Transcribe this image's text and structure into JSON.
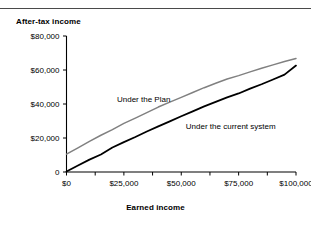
{
  "chart_data": {
    "type": "line",
    "title": "",
    "xlabel": "Earned income",
    "ylabel": "After-tax income",
    "xlim": [
      0,
      100000
    ],
    "ylim": [
      0,
      80000
    ],
    "grid": false,
    "legend_position": "inline-annotations",
    "x_ticks": [
      "$0",
      "$25,000",
      "$50,000",
      "$75,000",
      "$100,000"
    ],
    "x_tick_values": [
      0,
      25000,
      50000,
      75000,
      100000
    ],
    "x_minor_tick_values": [
      12500,
      37500,
      62500,
      87500
    ],
    "y_ticks": [
      "0",
      "$20,000",
      "$40,000",
      "$60,000",
      "$80,000"
    ],
    "y_tick_values": [
      0,
      20000,
      40000,
      60000,
      80000
    ],
    "series": [
      {
        "name": "Under the Plan",
        "color": "#808080",
        "label_x": 22000,
        "label_y": 41000,
        "x": [
          0,
          5000,
          10000,
          15000,
          20000,
          25000,
          30000,
          35000,
          40000,
          45000,
          50000,
          55000,
          60000,
          65000,
          70000,
          75000,
          80000,
          85000,
          90000,
          95000,
          100000
        ],
        "values": [
          10500,
          14200,
          18000,
          21600,
          24900,
          28600,
          31700,
          34900,
          38200,
          41100,
          43900,
          46800,
          49600,
          52200,
          54700,
          56700,
          58900,
          61000,
          63000,
          65000,
          66800
        ]
      },
      {
        "name": "Under the current system",
        "color": "#000000",
        "label_x": 52000,
        "label_y": 25500,
        "x": [
          0,
          5000,
          10000,
          15000,
          20000,
          25000,
          30000,
          35000,
          40000,
          45000,
          50000,
          55000,
          60000,
          65000,
          70000,
          75000,
          80000,
          85000,
          90000,
          95000,
          100000
        ],
        "values": [
          300,
          3800,
          7300,
          10300,
          14400,
          17600,
          20600,
          23800,
          26800,
          29800,
          32800,
          35700,
          38600,
          41300,
          43900,
          46200,
          49000,
          51600,
          54400,
          57300,
          62600
        ]
      }
    ]
  }
}
